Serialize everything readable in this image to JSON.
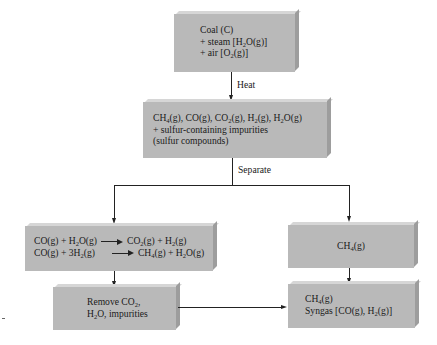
{
  "diagram": {
    "nodes": {
      "coal": {
        "line1": "Coal (C)",
        "line2_pre": "+ steam [H",
        "line2_sub": "2",
        "line2_post": "O(g)]",
        "line3_pre": "+ air [O",
        "line3_sub": "2",
        "line3_post": "(g)]"
      },
      "mixture": {
        "line1": {
          "a": "CH",
          "a_sub": "4",
          "b": "(g), CO(g), CO",
          "b_sub": "2",
          "c": "(g), H",
          "c_sub": "2",
          "d": "(g), H",
          "d_sub": "2",
          "e": "O(g)"
        },
        "line2": "+ sulfur-containing impurities",
        "line3": "(sulfur compounds)"
      },
      "reactions": {
        "r1_left_a": "CO(g) + H",
        "r1_left_sub": "2",
        "r1_left_b": "O(g)",
        "r1_right_a": "CO",
        "r1_right_sub1": "2",
        "r1_right_b": "(g) + H",
        "r1_right_sub2": "2",
        "r1_right_c": "(g)",
        "r2_left_a": "CO(g) + 3H",
        "r2_left_sub": "2",
        "r2_left_b": "(g)",
        "r2_right_a": "CH",
        "r2_right_sub1": "4",
        "r2_right_b": "(g) + H",
        "r2_right_sub2": "2",
        "r2_right_c": "O(g)"
      },
      "methane": {
        "a": "CH",
        "sub": "4",
        "b": "(g)"
      },
      "remove": {
        "line1_a": "Remove CO",
        "line1_sub": "2",
        "line1_b": ",",
        "line2_a": "H",
        "line2_sub": "2",
        "line2_b": "O, impurities"
      },
      "product": {
        "line1_a": "CH",
        "line1_sub": "4",
        "line1_b": "(g)",
        "line2_a": "Syngas [CO(g), H",
        "line2_sub": "2",
        "line2_b": "(g)]"
      }
    },
    "edges": {
      "heat_label": "Heat",
      "separate_label": "Separate"
    },
    "colors": {
      "box_fill": "#b9b9b9",
      "box_top_edge": "#d6d6d6",
      "box_side_edge": "#9d9d9d",
      "line": "#222222"
    }
  }
}
